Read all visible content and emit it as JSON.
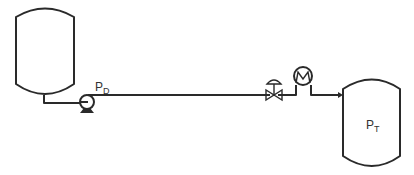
{
  "diagram": {
    "type": "process-flow",
    "components": [
      {
        "id": "supply-tank",
        "kind": "vessel"
      },
      {
        "id": "pump",
        "kind": "centrifugal-pump"
      },
      {
        "id": "control-valve",
        "kind": "control-valve"
      },
      {
        "id": "flow-meter",
        "kind": "instrument"
      },
      {
        "id": "receiving-tank",
        "kind": "vessel"
      }
    ],
    "labels": {
      "discharge_pressure": {
        "main": "P",
        "sub": "D"
      },
      "tank_pressure": {
        "main": "P",
        "sub": "T"
      }
    },
    "colors": {
      "line": "#2a2a2a",
      "background": "#ffffff"
    }
  }
}
